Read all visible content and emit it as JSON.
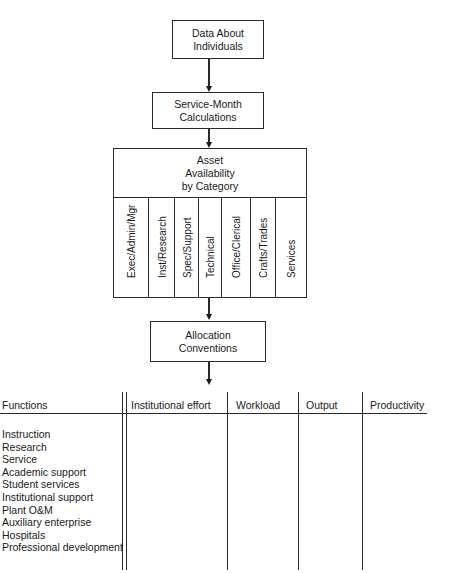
{
  "flowchart": {
    "box_data_about_individuals": "Data About Individuals",
    "box_data_line1": "Data About",
    "box_data_line2": "Individuals",
    "box_service_month_line1": "Service-Month",
    "box_service_month_line2": "Calculations",
    "box_asset_line1": "Asset",
    "box_asset_line2": "Availability",
    "box_asset_line3": "by Category",
    "asset_categories": [
      "Exec/Admin/Mgr",
      "Inst/Research",
      "Spec/Support",
      "Technical",
      "Office/Clerical",
      "Crafts/Trades",
      "Services"
    ],
    "box_allocation_line1": "Allocation",
    "box_allocation_line2": "Conventions"
  },
  "table": {
    "headers": [
      "Functions",
      "Institutional effort",
      "Workload",
      "Output",
      "Productivity"
    ],
    "functions": [
      "Instruction",
      "Research",
      "Service",
      "Academic support",
      "Student services",
      "Institutional support",
      "Plant O&M",
      "Auxiliary enterprise",
      "Hospitals",
      "Professional development"
    ]
  }
}
